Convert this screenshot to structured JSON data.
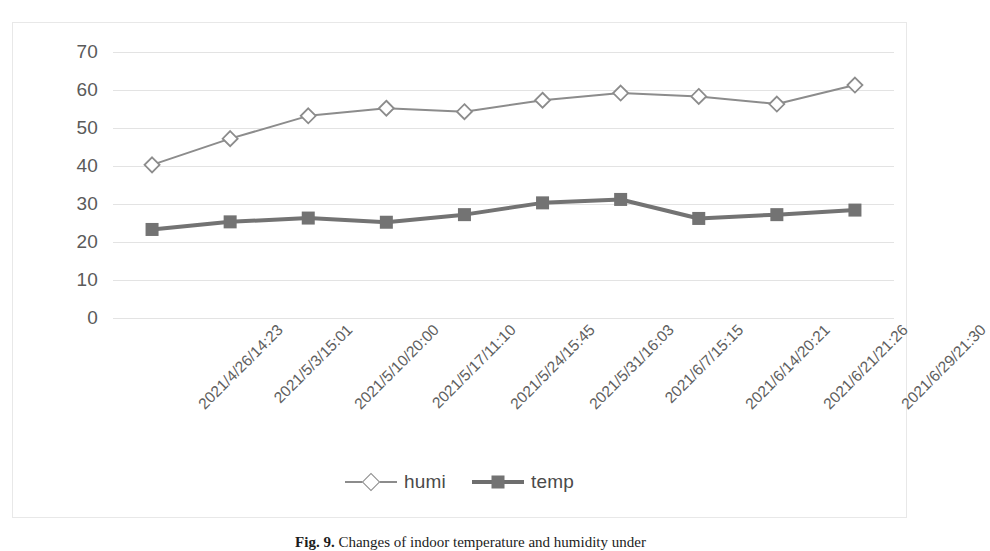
{
  "chart_data": {
    "type": "line",
    "title": "",
    "xlabel": "",
    "ylabel": "",
    "ylim": [
      0,
      70
    ],
    "yticks": [
      0,
      10,
      20,
      30,
      40,
      50,
      60,
      70
    ],
    "grid": true,
    "legend_position": "bottom",
    "categories": [
      "2021/4/26/14:23",
      "2021/5/3/15:01",
      "2021/5/10/20:00",
      "2021/5/17/11:10",
      "2021/5/24/15:45",
      "2021/5/31/16:03",
      "2021/6/7/15:15",
      "2021/6/14/20:21",
      "2021/6/21/21:26",
      "2021/6/29/21:30"
    ],
    "series": [
      {
        "name": "humi",
        "marker": "open-diamond",
        "color": "#8c8c8c",
        "values": [
          40.3,
          47.2,
          53.2,
          55.2,
          54.3,
          57.3,
          59.2,
          58.3,
          56.3,
          61.3
        ]
      },
      {
        "name": "temp",
        "marker": "filled-square",
        "color": "#737373",
        "values": [
          23.3,
          25.3,
          26.3,
          25.2,
          27.2,
          30.3,
          31.2,
          26.2,
          27.2,
          28.4
        ]
      }
    ]
  },
  "legend": {
    "entries": [
      {
        "label": "humi"
      },
      {
        "label": "temp"
      }
    ]
  },
  "caption": {
    "figure_number": "Fig. 9.",
    "text": "Changes of indoor temperature and humidity under"
  },
  "colors": {
    "humi_line": "#8c8c8c",
    "temp_line": "#6e6e6e",
    "gridline": "#e3e3e3",
    "frame": "#e8e8e8",
    "tick_text": "#5a5a5a"
  }
}
